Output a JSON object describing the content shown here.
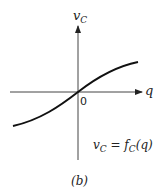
{
  "diagram": {
    "y_axis_label": {
      "main": "v",
      "sub": "C"
    },
    "x_axis_label": "q",
    "origin_label": "0",
    "equation": {
      "lhs_main": "v",
      "lhs_sub": "C",
      "eq": " = ",
      "f_main": "f",
      "f_sub": "C",
      "arg": "(q)"
    },
    "caption": "(b)",
    "curve": "S-shaped monotonically increasing curve through origin"
  }
}
